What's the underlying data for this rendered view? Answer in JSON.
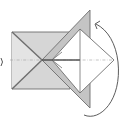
{
  "diagram": {
    "type": "origami-fold-step",
    "caption": "",
    "colors": {
      "background": "#ffffff",
      "paper_back": "#c9c9c9",
      "paper_mid": "#dcdcdc",
      "paper_front": "#ffffff",
      "line": "#6e6e6e",
      "crease": "#9a9a9a",
      "arrow": "#4a4a4a"
    },
    "elements": [
      {
        "name": "left-square",
        "description": "square base with diagonal creases"
      },
      {
        "name": "back-flap",
        "description": "gray triangular flap behind"
      },
      {
        "name": "front-diamond",
        "description": "white diamond flap in front"
      },
      {
        "name": "center-crease",
        "description": "horizontal dash-dot valley line"
      },
      {
        "name": "turn-over-arrow",
        "description": "curved arrow indicating flip/turn"
      }
    ]
  }
}
